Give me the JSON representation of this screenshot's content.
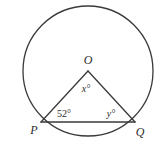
{
  "figure": {
    "name": "circle-with-inscribed-isosceles-triangle",
    "background_color": "#ffffff",
    "stroke_color": "#3a3a3a",
    "text_color": "#2b2b2b",
    "circle": {
      "name": "circle",
      "center_x": 88,
      "center_y": 71,
      "radius": 65,
      "stroke_width": 1.3
    },
    "center_point": {
      "label": "O",
      "x": 88,
      "y": 71,
      "label_x": 88,
      "label_y": 64
    },
    "vertices": [
      {
        "name": "point-p",
        "label": "P",
        "x": 41,
        "y": 122,
        "label_x": 34,
        "label_y": 134
      },
      {
        "name": "point-q",
        "label": "Q",
        "x": 135,
        "y": 122,
        "label_x": 140,
        "label_y": 136
      }
    ],
    "segments": [
      {
        "name": "radius-op",
        "from": "O",
        "to": "P"
      },
      {
        "name": "radius-oq",
        "from": "O",
        "to": "Q"
      },
      {
        "name": "chord-pq",
        "from": "P",
        "to": "Q"
      }
    ],
    "angle_labels": [
      {
        "name": "angle-x-at-center",
        "text": "x°",
        "variable": "x",
        "x": 86,
        "y": 92,
        "style": "italic"
      },
      {
        "name": "angle-52-at-p",
        "text": "52°",
        "value": 52,
        "unit": "degrees",
        "x": 64,
        "y": 117,
        "style": "normal"
      },
      {
        "name": "angle-y-at-q",
        "text": "y°",
        "variable": "y",
        "x": 111,
        "y": 117,
        "style": "italic"
      }
    ]
  }
}
